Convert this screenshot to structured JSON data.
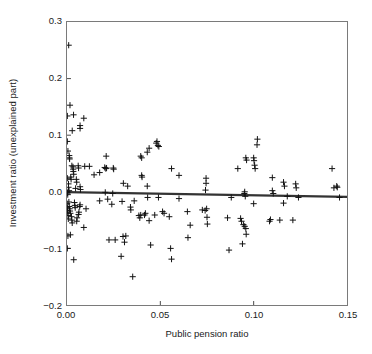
{
  "chart_data": {
    "type": "scatter",
    "title": "",
    "xlabel": "Public pension ratio",
    "ylabel": "Investment ratio (unexplained part)",
    "xlim": [
      0.0,
      0.15
    ],
    "ylim": [
      -0.2,
      0.3
    ],
    "xticks": [
      0.0,
      0.05,
      0.1,
      0.15
    ],
    "xtick_labels": [
      "0.00",
      "0.05",
      "0.10",
      "0.15"
    ],
    "yticks": [
      -0.2,
      -0.1,
      0.0,
      0.1,
      0.2,
      0.3
    ],
    "ytick_labels": [
      "-0.2",
      "-0.1",
      "0.0",
      "0.1",
      "0.2",
      "0.3"
    ],
    "grid": false,
    "legend": null,
    "marker": "plus",
    "marker_color": "#111111",
    "series": [
      {
        "name": "observations",
        "marker": "+",
        "points": [
          [
            0.0009,
            0.259
          ],
          [
            0.0016,
            0.153
          ],
          [
            0.0002,
            0.134
          ],
          [
            0.0035,
            0.136
          ],
          [
            0.009,
            0.13
          ],
          [
            0.0028,
            0.108
          ],
          [
            0.007,
            0.112
          ],
          [
            0.007,
            0.117
          ],
          [
            0.0002,
            0.089
          ],
          [
            0.0005,
            0.072
          ],
          [
            0.0012,
            0.064
          ],
          [
            0.0013,
            0.06
          ],
          [
            0.0014,
            0.058
          ],
          [
            0.021,
            0.063
          ],
          [
            0.04,
            0.06
          ],
          [
            0.0395,
            0.063
          ],
          [
            0.044,
            0.077
          ],
          [
            0.043,
            0.07
          ],
          [
            0.0478,
            0.086
          ],
          [
            0.0482,
            0.089
          ],
          [
            0.0487,
            0.082
          ],
          [
            0.0492,
            0.08
          ],
          [
            0.102,
            0.093
          ],
          [
            0.1018,
            0.083
          ],
          [
            0.0958,
            0.06
          ],
          [
            0.0962,
            0.056
          ],
          [
            0.1,
            0.06
          ],
          [
            0.1002,
            0.055
          ],
          [
            0.1005,
            0.047
          ],
          [
            0.1008,
            0.041
          ],
          [
            0.0915,
            0.041
          ],
          [
            0.056,
            0.041
          ],
          [
            0.04,
            0.029
          ],
          [
            0.0402,
            0.026
          ],
          [
            0.0745,
            0.024
          ],
          [
            0.0745,
            0.015
          ],
          [
            0.0742,
            0.003
          ],
          [
            0.142,
            0.041
          ],
          [
            0.11,
            0.025
          ],
          [
            0.116,
            0.017
          ],
          [
            0.1165,
            0.01
          ],
          [
            0.1225,
            0.014
          ],
          [
            0.1228,
            0.007
          ],
          [
            0.143,
            0.007
          ],
          [
            0.1445,
            0.01
          ],
          [
            0.1448,
            0.008
          ],
          [
            0.0026,
            0.046
          ],
          [
            0.0032,
            0.044
          ],
          [
            0.0033,
            0.04
          ],
          [
            0.0034,
            0.036
          ],
          [
            0.0036,
            0.031
          ],
          [
            0.006,
            0.046
          ],
          [
            0.0062,
            0.042
          ],
          [
            0.0095,
            0.045
          ],
          [
            0.012,
            0.045
          ],
          [
            0.0145,
            0.03
          ],
          [
            0.0202,
            0.043
          ],
          [
            0.0208,
            0.041
          ],
          [
            0.0212,
            0.042
          ],
          [
            0.0248,
            0.042
          ],
          [
            0.025,
            0.04
          ],
          [
            0.0175,
            0.034
          ],
          [
            0.002,
            0.026
          ],
          [
            0.0022,
            0.022
          ],
          [
            0.005,
            0.022
          ],
          [
            0.0052,
            0.017
          ],
          [
            0.0302,
            0.015
          ],
          [
            0.0325,
            0.01
          ],
          [
            0.043,
            0.01
          ],
          [
            0.06,
            0.029
          ],
          [
            0.0002,
            0.024
          ],
          [
            0.0008,
            0.014
          ],
          [
            0.0008,
            0.008
          ],
          [
            0.0011,
            0.002
          ],
          [
            0.0046,
            0.006
          ],
          [
            0.007,
            0.009
          ],
          [
            0.0072,
            0.004
          ],
          [
            0.0,
            0.0
          ],
          [
            0.0003,
            -0.002
          ],
          [
            0.0004,
            -0.005
          ],
          [
            0.0205,
            -0.001
          ],
          [
            0.0245,
            -0.003
          ],
          [
            0.0432,
            -0.01
          ],
          [
            0.049,
            -0.01
          ],
          [
            0.095,
            -0.003
          ],
          [
            0.0952,
            0.0
          ],
          [
            0.0955,
            -0.008
          ],
          [
            0.088,
            -0.01
          ],
          [
            0.11,
            0.002
          ],
          [
            0.1105,
            -0.003
          ],
          [
            0.118,
            -0.008
          ],
          [
            0.124,
            -0.01
          ],
          [
            0.146,
            -0.01
          ],
          [
            0.06,
            -0.012
          ],
          [
            0.0295,
            -0.017
          ],
          [
            0.036,
            -0.016
          ],
          [
            0.0218,
            -0.013
          ],
          [
            0.0175,
            -0.016
          ],
          [
            0.024,
            -0.022
          ],
          [
            0.0102,
            -0.03
          ],
          [
            0.0062,
            -0.04
          ],
          [
            0.0064,
            -0.036
          ],
          [
            0.0068,
            -0.026
          ],
          [
            0.007,
            -0.023
          ],
          [
            0.004,
            -0.019
          ],
          [
            0.0042,
            -0.024
          ],
          [
            0.0044,
            -0.028
          ],
          [
            0.001,
            -0.018
          ],
          [
            0.0012,
            -0.026
          ],
          [
            0.0014,
            -0.03
          ],
          [
            0.0016,
            -0.034
          ],
          [
            0.0018,
            -0.038
          ],
          [
            0.0001,
            -0.021
          ],
          [
            0.0002,
            -0.028
          ],
          [
            0.0003,
            -0.033
          ],
          [
            0.0004,
            -0.037
          ],
          [
            0.0006,
            -0.042
          ],
          [
            0.0007,
            -0.048
          ],
          [
            0.0024,
            -0.044
          ],
          [
            0.0026,
            -0.05
          ],
          [
            0.0028,
            -0.055
          ],
          [
            0.009,
            -0.063
          ],
          [
            0.0052,
            -0.052
          ],
          [
            0.0054,
            -0.046
          ],
          [
            0.034,
            -0.027
          ],
          [
            0.0342,
            -0.032
          ],
          [
            0.0385,
            -0.042
          ],
          [
            0.039,
            -0.046
          ],
          [
            0.0395,
            -0.041
          ],
          [
            0.0415,
            -0.041
          ],
          [
            0.042,
            -0.038
          ],
          [
            0.044,
            -0.051
          ],
          [
            0.047,
            -0.041
          ],
          [
            0.0512,
            -0.035
          ],
          [
            0.052,
            -0.038
          ],
          [
            0.0548,
            -0.044
          ],
          [
            0.0645,
            -0.035
          ],
          [
            0.066,
            -0.059
          ],
          [
            0.0725,
            -0.032
          ],
          [
            0.074,
            -0.033
          ],
          [
            0.0748,
            -0.03
          ],
          [
            0.075,
            -0.045
          ],
          [
            0.0752,
            -0.057
          ],
          [
            0.086,
            -0.046
          ],
          [
            0.093,
            -0.047
          ],
          [
            0.0935,
            -0.052
          ],
          [
            0.0945,
            -0.058
          ],
          [
            0.0952,
            -0.061
          ],
          [
            0.0958,
            -0.065
          ],
          [
            0.096,
            -0.075
          ],
          [
            0.1085,
            -0.052
          ],
          [
            0.109,
            -0.049
          ],
          [
            0.114,
            -0.05
          ],
          [
            0.121,
            -0.05
          ],
          [
            0.116,
            -0.02
          ],
          [
            0.1,
            -0.021
          ],
          [
            0.0005,
            -0.078
          ],
          [
            0.0018,
            -0.076
          ],
          [
            0.0002,
            -0.1
          ],
          [
            0.0036,
            -0.12
          ],
          [
            0.0225,
            -0.085
          ],
          [
            0.0258,
            -0.085
          ],
          [
            0.03,
            -0.079
          ],
          [
            0.0315,
            -0.078
          ],
          [
            0.0308,
            -0.089
          ],
          [
            0.029,
            -0.114
          ],
          [
            0.0352,
            -0.15
          ],
          [
            0.0448,
            -0.094
          ],
          [
            0.0555,
            -0.1
          ],
          [
            0.056,
            -0.119
          ],
          [
            0.0648,
            -0.081
          ],
          [
            0.0868,
            -0.103
          ],
          [
            0.094,
            -0.092
          ]
        ]
      }
    ],
    "fit_line": {
      "name": "regression line",
      "x": [
        0.0,
        0.15
      ],
      "y": [
        -0.0005,
        -0.009
      ],
      "color": "#333333"
    }
  }
}
